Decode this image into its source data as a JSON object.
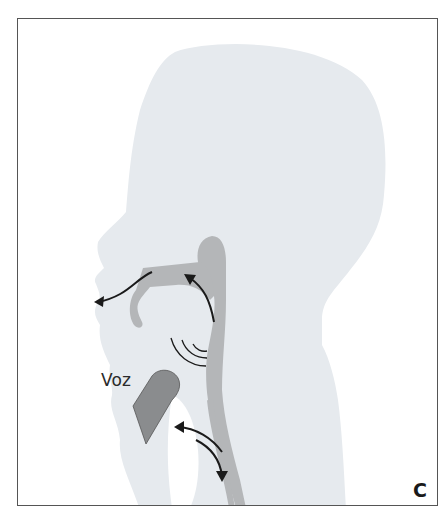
{
  "figure": {
    "panel_label": "C",
    "labels": {
      "voice": "Voz"
    },
    "colors": {
      "head_silhouette": "#e6eaee",
      "vocal_tract": "#b4b6b8",
      "device": "#8a8c8e",
      "arrows": "#1a1a1a",
      "frame_border": "#555555",
      "background": "#ffffff"
    },
    "annotations": [
      {
        "id": "oral-airflow-arrow",
        "meaning": "air exiting through mouth"
      },
      {
        "id": "pharynx-upward-arrow",
        "meaning": "airflow rising through pharynx to oral cavity"
      },
      {
        "id": "sound-waves",
        "meaning": "sound generation"
      },
      {
        "id": "speaking-valve",
        "meaning": "voice device at neck"
      },
      {
        "id": "bidirectional-neck-arrows",
        "meaning": "air redirected between trachea and esophagus"
      }
    ]
  }
}
